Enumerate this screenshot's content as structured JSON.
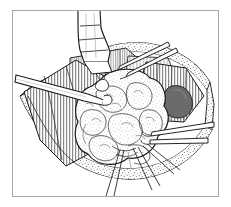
{
  "figure": {
    "title": "Surgical line illustration of open neck dissection with lobulated mass",
    "domain_kind": "medical-line-drawing",
    "style": "pen-and-ink hatched line art, monochrome",
    "canvas": {
      "width": 231,
      "height": 207,
      "background": "#ffffff"
    },
    "frame": {
      "name": "image-border",
      "stroke": "#a8a8a8",
      "stroke_width": 1,
      "inset_left": 12,
      "inset_top": 10,
      "inset_right": 12,
      "inset_bottom": 10
    },
    "palette": {
      "ink": "#1b1b1b",
      "ink_soft": "#4a4a4a",
      "hatch": "#3c3c3c",
      "hatch_light": "#6e6e6e",
      "stipple": "#5a5a5a",
      "shadow_fill": "#6b6b6b",
      "paper": "#ffffff",
      "frame": "#a8a8a8"
    },
    "elements": [
      {
        "name": "skin-wound-edge-upper",
        "label": "Upper skin and subcutaneous fat wound margin",
        "texture": "stippled band",
        "position": "upper arc of the exposure, running from left of center toward the upper right"
      },
      {
        "name": "skin-wound-edge-lower",
        "label": "Lower skin and subcutaneous fat wound margin",
        "texture": "stippled band",
        "position": "broad lower arc sweeping from the left edge under the mass to the right"
      },
      {
        "name": "muscle-flap-left",
        "label": "Retracted strap muscle, left side",
        "texture": "dense vertical hatching",
        "position": "left third of the field, fanning downward"
      },
      {
        "name": "muscle-flap-right",
        "label": "Retracted strap muscle, right side",
        "texture": "dense vertical hatching",
        "position": "right of the mass, fanning toward the lower right"
      },
      {
        "name": "muscle-flap-upper-center",
        "label": "Divided muscle belly beneath the retractor",
        "texture": "vertical hatching",
        "position": "upper center, under the broad retractor blade"
      },
      {
        "name": "lobulated-mass",
        "label": "Large lobulated mass being delivered from the wound",
        "texture": "stippled nodular surface with lobule outlines",
        "position": "center of the field, extending to lower center"
      },
      {
        "name": "deep-recess-shadow",
        "label": "Shaded deep recess beneath the right muscle flap",
        "texture": "solid gray fill",
        "position": "right of center, below the right muscle flap"
      },
      {
        "name": "retractor-blade-top",
        "label": "Broad retractor blade entering from above",
        "texture": "outlined instrument with shaft and flared blade",
        "position": "enters from top center, blade tip at the upper wound edge"
      },
      {
        "name": "instrument-left",
        "label": "Narrow retractor or dissector from the left",
        "texture": "long parallel-sided outlined shaft",
        "position": "enters from left edge, angles down and right toward the mass"
      },
      {
        "name": "instrument-upper-right",
        "label": "Paired clamp or forceps tines from the upper right",
        "texture": "two long thin parallel shafts",
        "position": "enters from upper right, tips converging at the upper wound edge"
      },
      {
        "name": "instrument-right",
        "label": "Clamp shafts at the right of the mass",
        "texture": "two long thin parallel shafts",
        "position": "enters from right edge at mid-low height toward the mass"
      },
      {
        "name": "sutures-lower",
        "label": "Fine suture or needle-holder lines below the mass",
        "texture": "thin converging straight lines",
        "position": "lower center, radiating downward off the mass"
      },
      {
        "name": "vessel-ligature-knot",
        "label": "Small tied vessel stump on the upper left of the mass",
        "texture": "small outlined nub with short tails",
        "position": "upper left shoulder of the mass"
      }
    ],
    "annotations": {
      "labels": [],
      "arrows": [],
      "caption": ""
    }
  }
}
